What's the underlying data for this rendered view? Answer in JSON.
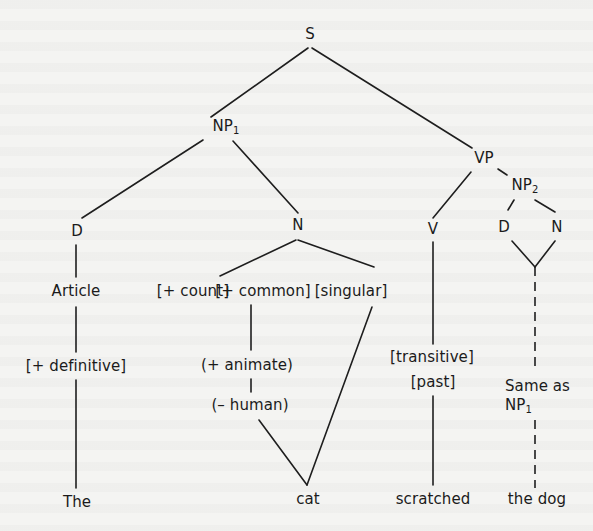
{
  "diagram": {
    "type": "syntax-tree",
    "colors": {
      "background": "#f4f4f2",
      "ink": "#1e1e1e"
    },
    "nodes": {
      "s": "S",
      "np1": {
        "base": "NP",
        "sub": "1"
      },
      "vp": "VP",
      "np1_d": "D",
      "np1_n": "N",
      "article": "Article",
      "count": "[+ count]",
      "common": "[+ common]",
      "singular": "[singular]",
      "definitive": "[+ definitive]",
      "animate": "(+ animate)",
      "human": "(– human)",
      "the": "The",
      "cat": "cat",
      "v": "V",
      "transitive": "[transitive]",
      "past": "[past]",
      "scratched": "scratched",
      "np2": {
        "base": "NP",
        "sub": "2"
      },
      "np2_d": "D",
      "np2_n": "N",
      "same_as": "Same as",
      "same_as_ref": {
        "base": "NP",
        "sub": "1"
      },
      "the_dog": "the dog"
    },
    "edges": [
      [
        "S",
        "NP1"
      ],
      [
        "S",
        "VP"
      ],
      [
        "NP1",
        "D"
      ],
      [
        "NP1",
        "N"
      ],
      [
        "D",
        "Article"
      ],
      [
        "Article",
        "[+ definitive]"
      ],
      [
        "[+ definitive]",
        "The"
      ],
      [
        "N",
        "[+ count]"
      ],
      [
        "N",
        "[singular]"
      ],
      [
        "[+ common]",
        "(+ animate)"
      ],
      [
        "(+ animate)",
        "(– human)"
      ],
      [
        "(– human)",
        "cat"
      ],
      [
        "[singular]",
        "cat"
      ],
      [
        "VP",
        "V"
      ],
      [
        "VP",
        "NP2"
      ],
      [
        "V",
        "[transitive]"
      ],
      [
        "[past]",
        "scratched"
      ],
      [
        "NP2",
        "D"
      ],
      [
        "NP2",
        "N"
      ],
      [
        "D",
        "join"
      ],
      [
        "N",
        "join"
      ],
      [
        "join",
        "Same as NP1",
        "dashed"
      ],
      [
        "Same as NP1",
        "the dog",
        "dashed"
      ]
    ]
  }
}
